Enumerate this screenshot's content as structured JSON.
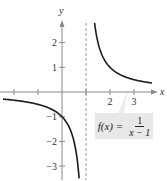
{
  "chart_data": {
    "type": "line",
    "title": "",
    "xlabel": "x",
    "ylabel": "y",
    "function": "f(x) = 1/(x-1)",
    "xlim": [
      -2.5,
      3.9
    ],
    "ylim": [
      -3.5,
      2.9
    ],
    "x_ticks": [
      -2,
      -1,
      1,
      2,
      3
    ],
    "x_tick_labels": [
      {
        "value": 2,
        "label": "2"
      },
      {
        "value": 3,
        "label": "3"
      }
    ],
    "y_ticks": [
      -3,
      -2,
      -1,
      1,
      2
    ],
    "y_tick_labels": [
      {
        "value": 2,
        "label": "2"
      },
      {
        "value": 1,
        "label": "1"
      },
      {
        "value": -1,
        "label": "−1"
      },
      {
        "value": -2,
        "label": "−2"
      },
      {
        "value": -3,
        "label": "−3"
      }
    ],
    "asymptotes": [
      {
        "type": "vertical",
        "x": 1,
        "style": "dashed"
      }
    ],
    "series": [
      {
        "name": "left branch",
        "x": [
          -2.46,
          -2.0,
          -1.5,
          -1.0,
          -0.5,
          0.0,
          0.25,
          0.5,
          0.6,
          0.7,
          0.714
        ],
        "y": [
          -0.289,
          -0.333,
          -0.4,
          -0.5,
          -0.667,
          -1.0,
          -1.333,
          -2.0,
          -2.5,
          -3.333,
          -3.5
        ]
      },
      {
        "name": "right branch",
        "x": [
          1.357,
          1.4,
          1.5,
          1.75,
          2.0,
          2.5,
          3.0,
          3.5,
          3.75
        ],
        "y": [
          2.8,
          2.5,
          2.0,
          1.333,
          1.0,
          0.667,
          0.5,
          0.4,
          0.364
        ]
      }
    ],
    "grid": false,
    "legend": null,
    "annotation": {
      "lhs": "f(x) =",
      "numerator": "1",
      "denominator": "x − 1",
      "background": "#e8e8e8"
    }
  },
  "colors": {
    "curve": "#1a1a1a",
    "axis": "#8a8a8a",
    "asymptote": "#9a9a9a",
    "label_bg": "#e8e8e8"
  }
}
